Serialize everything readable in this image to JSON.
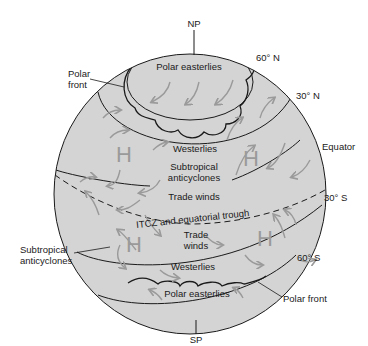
{
  "diagram": {
    "type": "global atmospheric circulation globe",
    "poles": {
      "north": "NP",
      "south": "SP"
    },
    "latitudes": [
      "60° N",
      "30° N",
      "Equator",
      "30° S",
      "60° S"
    ],
    "zones": {
      "north_polar": "Polar easterlies",
      "north_westerlies": "Westerlies",
      "north_subtropical": "Subtropical anticyclones",
      "north_trades": "Trade winds",
      "itcz": "ITCZ and equatorial trough",
      "south_trades_line1": "Trade",
      "south_trades_line2": "winds",
      "south_westerlies": "Westerlies",
      "south_polar": "Polar easterlies"
    },
    "callouts": {
      "polar_front_north_line1": "Polar",
      "polar_front_north_line2": "front",
      "subtropical_south_line1": "Subtropical",
      "subtropical_south_line2": "anticyclones",
      "polar_front_south": "Polar front"
    },
    "high_pressure_symbol": "H",
    "colors": {
      "globe_fill": "#d4d4d4",
      "arrow": "#9a9a9a",
      "line": "#1a1a1a"
    }
  }
}
